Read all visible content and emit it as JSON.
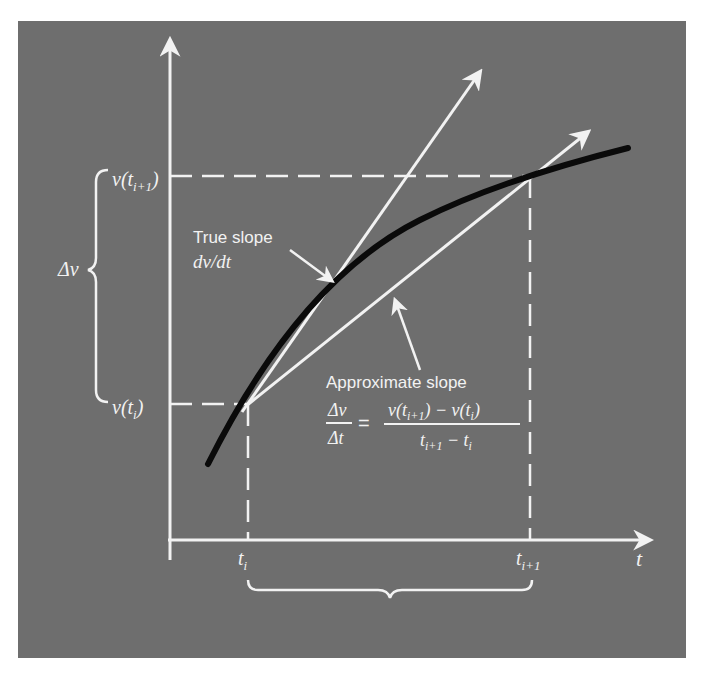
{
  "figure": {
    "background_color": "#6e6e6e",
    "line_color": "#f2f2f2",
    "curve_color": "#0a0a0a",
    "axes": {
      "x_label": "t",
      "y_label": ""
    },
    "ticks": {
      "x": [
        {
          "base": "t",
          "sub": "i"
        },
        {
          "base": "t",
          "sub": "i+1"
        }
      ],
      "y": [
        {
          "text": "v(t",
          "sub": "i",
          "close": ")"
        },
        {
          "text": "v(t",
          "sub": "i+1",
          "close": ")"
        }
      ]
    },
    "delta_v_label": "Δv",
    "true_slope": {
      "title": "True slope",
      "expr": "dv/dt"
    },
    "approx_slope": {
      "title": "Approximate slope",
      "lhs_num": "Δv",
      "lhs_den": "Δt",
      "eq": "=",
      "rhs_num": "v(t",
      "rhs_num_sub1": "i+1",
      "rhs_num_mid": ") − v(t",
      "rhs_num_sub2": "i",
      "rhs_num_end": ")",
      "rhs_den": "t",
      "rhs_den_sub1": "i+1",
      "rhs_den_mid": " − t",
      "rhs_den_sub2": "i"
    }
  }
}
